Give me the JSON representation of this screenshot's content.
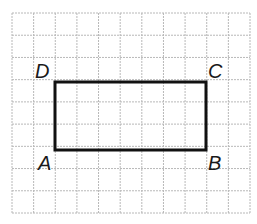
{
  "diagram": {
    "type": "grid-rectangle",
    "grid": {
      "columns": 11,
      "rows": 9,
      "color": "#b8b8b8"
    },
    "rectangle": {
      "color": "#111111",
      "from_col": 2,
      "to_col": 9,
      "from_row": 3,
      "to_row": 6,
      "width_units": 7,
      "height_units": 3
    },
    "vertices": [
      {
        "name": "A",
        "label": "A",
        "position": "bottom-left"
      },
      {
        "name": "B",
        "label": "B",
        "position": "bottom-right"
      },
      {
        "name": "C",
        "label": "C",
        "position": "top-right"
      },
      {
        "name": "D",
        "label": "D",
        "position": "top-left"
      }
    ]
  }
}
